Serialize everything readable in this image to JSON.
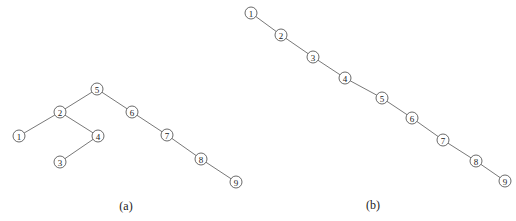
{
  "figures": [
    {
      "id": "a",
      "caption": "(a)",
      "caption_pos": [
        126,
        210
      ],
      "nodes": [
        {
          "label": "5",
          "x": 97,
          "y": 89
        },
        {
          "label": "2",
          "x": 60,
          "y": 112
        },
        {
          "label": "6",
          "x": 132,
          "y": 112
        },
        {
          "label": "1",
          "x": 19,
          "y": 136
        },
        {
          "label": "4",
          "x": 98,
          "y": 136
        },
        {
          "label": "3",
          "x": 60,
          "y": 162
        },
        {
          "label": "7",
          "x": 167,
          "y": 135
        },
        {
          "label": "8",
          "x": 201,
          "y": 159
        },
        {
          "label": "9",
          "x": 236,
          "y": 182
        }
      ],
      "edges": [
        [
          "5",
          "2"
        ],
        [
          "5",
          "6"
        ],
        [
          "2",
          "1"
        ],
        [
          "2",
          "4"
        ],
        [
          "4",
          "3"
        ],
        [
          "6",
          "7"
        ],
        [
          "7",
          "8"
        ],
        [
          "8",
          "9"
        ]
      ]
    },
    {
      "id": "b",
      "caption": "(b)",
      "caption_pos": [
        373,
        209
      ],
      "nodes": [
        {
          "label": "1",
          "x": 251,
          "y": 13
        },
        {
          "label": "2",
          "x": 281,
          "y": 35
        },
        {
          "label": "3",
          "x": 313,
          "y": 57
        },
        {
          "label": "4",
          "x": 345,
          "y": 78
        },
        {
          "label": "5",
          "x": 382,
          "y": 98
        },
        {
          "label": "6",
          "x": 412,
          "y": 118
        },
        {
          "label": "7",
          "x": 443,
          "y": 140
        },
        {
          "label": "8",
          "x": 476,
          "y": 161
        },
        {
          "label": "9",
          "x": 505,
          "y": 181
        }
      ],
      "edges": [
        [
          "1",
          "2"
        ],
        [
          "2",
          "3"
        ],
        [
          "3",
          "4"
        ],
        [
          "4",
          "5"
        ],
        [
          "5",
          "6"
        ],
        [
          "6",
          "7"
        ],
        [
          "7",
          "8"
        ],
        [
          "8",
          "9"
        ]
      ]
    }
  ],
  "node_radius": 6
}
